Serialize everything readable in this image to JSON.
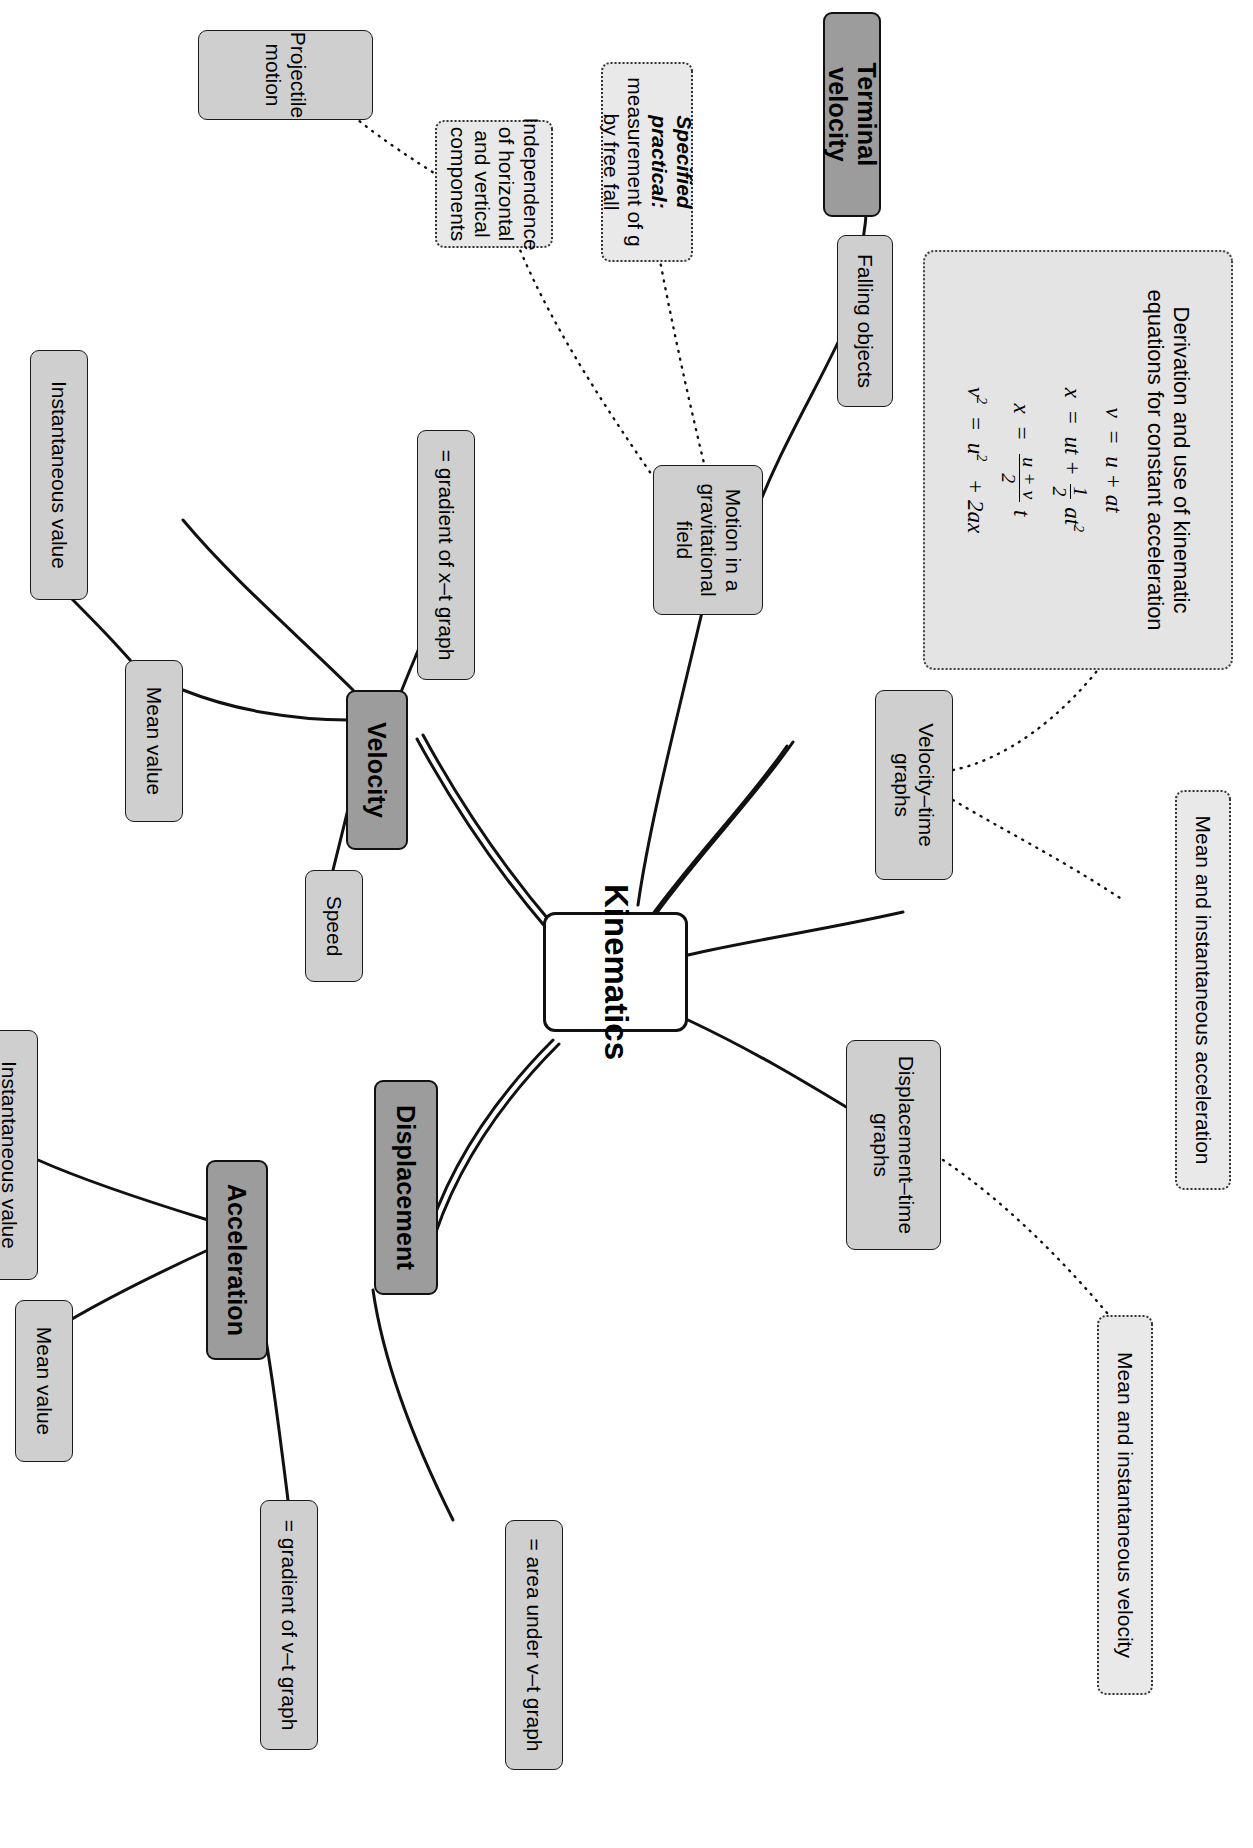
{
  "diagram": {
    "centre": {
      "label": "Kinematics"
    },
    "colors": {
      "centre_fill": "#ffffff",
      "primary_fill": "#9c9c9c",
      "secondary_fill": "#cfcfcf",
      "dotted_fill": "#e9e9e9",
      "stroke": "#111111"
    },
    "nodes": {
      "formula_box": {
        "title": "Derivation and use of kinematic equations for constant acceleration",
        "equations": [
          "v = u + at",
          "x = ut + 1/2 at²",
          "x = (u + v)/2 t",
          "v² = u² + 2ax"
        ],
        "eq1_lhs": "v",
        "eq1_rhs": "u + at",
        "eq2_lhs": "x",
        "eq2_rhs_a": "ut +",
        "eq2_num": "1",
        "eq2_den": "2",
        "eq2_rhs_b": "at",
        "eq3_lhs": "x",
        "eq3_num": "u + v",
        "eq3_den": "2",
        "eq3_tail": "t",
        "eq4_lhs": "v",
        "eq4_rhs": "u",
        "eq4_tail": "+ 2ax"
      },
      "mean_instantaneous_acceleration": "Mean and instantaneous acceleration",
      "mean_instantaneous_velocity": "Mean and instantaneous velocity",
      "terminal_velocity": "Terminal velocity",
      "falling_objects": "Falling objects",
      "velocity_time_graphs": "Velocity–time graphs",
      "displacement_time_graphs": "Displacement–time graphs",
      "displacement": "Displacement",
      "area_under_vt": "= area under v–t graph",
      "specified_practical_l1": "Specified practical:",
      "specified_practical_l2": "measurement",
      "specified_practical_l3": "of g by free fall",
      "motion_gravitational_field": "Motion in a gravitational field",
      "independence_components": "Independence of horizontal and vertical components",
      "projectile_motion": "Projectile motion",
      "gradient_xt": "= gradient of x–t graph",
      "velocity": "Velocity",
      "speed": "Speed",
      "velocity_instantaneous_value": "Instantaneous value",
      "velocity_mean_value": "Mean value",
      "acceleration": "Acceleration",
      "gradient_vt": "= gradient of v–t graph",
      "acceleration_instantaneous_value": "Instantaneous value",
      "acceleration_mean_value": "Mean value"
    }
  }
}
